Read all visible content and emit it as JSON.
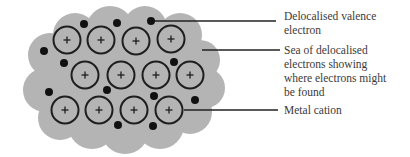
{
  "diagram": {
    "colors": {
      "sea": "#b4b4b4",
      "outline": "#1e1e1e",
      "electron": "#111111",
      "text": "#3a3a3a",
      "leader": "#222222"
    },
    "cations": [
      {
        "cx": 67,
        "cy": 40,
        "sign": "+"
      },
      {
        "cx": 101,
        "cy": 40,
        "sign": "+"
      },
      {
        "cx": 136,
        "cy": 41,
        "sign": "+"
      },
      {
        "cx": 171,
        "cy": 39,
        "sign": "+"
      },
      {
        "cx": 85,
        "cy": 75,
        "sign": "+"
      },
      {
        "cx": 121,
        "cy": 75,
        "sign": "+"
      },
      {
        "cx": 156,
        "cy": 75,
        "sign": "+"
      },
      {
        "cx": 190,
        "cy": 75,
        "sign": "+"
      },
      {
        "cx": 65,
        "cy": 110,
        "sign": "+"
      },
      {
        "cx": 99,
        "cy": 110,
        "sign": "+"
      },
      {
        "cx": 134,
        "cy": 110,
        "sign": "+"
      },
      {
        "cx": 169,
        "cy": 110,
        "sign": "+"
      }
    ],
    "electrons": [
      {
        "cx": 84,
        "cy": 24
      },
      {
        "cx": 117,
        "cy": 23
      },
      {
        "cx": 151,
        "cy": 21
      },
      {
        "cx": 44,
        "cy": 51
      },
      {
        "cx": 64,
        "cy": 63
      },
      {
        "cx": 174,
        "cy": 62
      },
      {
        "cx": 49,
        "cy": 92
      },
      {
        "cx": 107,
        "cy": 90
      },
      {
        "cx": 154,
        "cy": 96
      },
      {
        "cx": 195,
        "cy": 100
      },
      {
        "cx": 118,
        "cy": 125
      },
      {
        "cx": 153,
        "cy": 126
      }
    ],
    "labels": [
      {
        "id": "valence-electron",
        "text": "Delocalised valence\nelectron",
        "top": 9,
        "line": {
          "x1": 151,
          "y1": 21,
          "x2": 276,
          "y2": 21
        }
      },
      {
        "id": "electron-sea",
        "text": "Sea of delocalised\nelectrons showing\nwhere electrons might\nbe found",
        "top": 43,
        "line": {
          "x1": 202,
          "y1": 50,
          "x2": 280,
          "y2": 50
        }
      },
      {
        "id": "metal-cation",
        "text": "Metal cation",
        "top": 103,
        "line": {
          "x1": 184,
          "y1": 110,
          "x2": 278,
          "y2": 110
        }
      }
    ]
  }
}
